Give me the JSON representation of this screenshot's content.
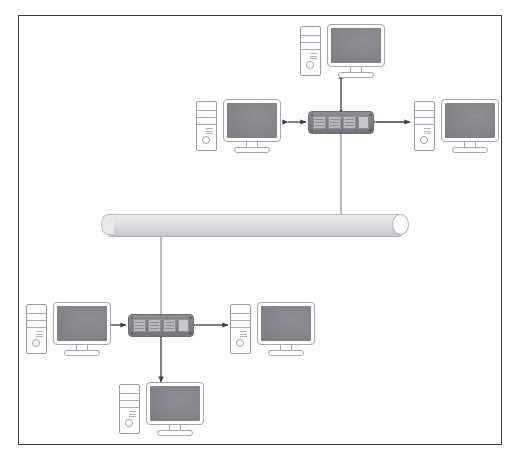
{
  "page": {
    "clipped_top_text": "··    ·   ··",
    "background_color": "#ffffff",
    "frame_border_color": "#3b3b42"
  },
  "palette": {
    "device_outline": "#9a9aa2",
    "screen_fill": "#86868b",
    "switch_body": "#7e7e84",
    "switch_port": "#b9b9bd",
    "bus_fill": "#e2e2e5",
    "connector_line": "#8f8f95",
    "arrow_color": "#3b3b42"
  },
  "diagram": {
    "type": "network-topology",
    "bus": {
      "name": "backbone-bus",
      "label": "",
      "orientation": "horizontal",
      "shape": "cylinder",
      "x": 101,
      "y": 214,
      "width": 308,
      "height": 21
    },
    "switches": [
      {
        "id": "switch-top",
        "label": "",
        "x": 308,
        "y": 111,
        "ports": 3
      },
      {
        "id": "switch-bottom",
        "label": "",
        "x": 128,
        "y": 314,
        "ports": 3
      }
    ],
    "computers": [
      {
        "id": "pc-top-center",
        "label": "",
        "x": 300,
        "y": 24,
        "monitor_x": 27
      },
      {
        "id": "pc-mid-left",
        "label": "",
        "x": 196,
        "y": 99,
        "monitor_x": 27
      },
      {
        "id": "pc-mid-right",
        "label": "",
        "x": 414,
        "y": 99,
        "monitor_x": 27
      },
      {
        "id": "pc-bottom-left",
        "label": "",
        "x": 26,
        "y": 302,
        "monitor_x": 27
      },
      {
        "id": "pc-bottom-right",
        "label": "",
        "x": 230,
        "y": 302,
        "monitor_x": 27
      },
      {
        "id": "pc-bottom-lower",
        "label": "",
        "x": 119,
        "y": 382,
        "monitor_x": 27
      }
    ],
    "links": [
      {
        "id": "link-bus-switch-top",
        "from": "switch-top",
        "to": "bus",
        "style": "plain-line"
      },
      {
        "id": "link-bus-switch-bottom",
        "from": "bus",
        "to": "switch-bottom",
        "style": "plain-line"
      },
      {
        "id": "link-top-center-pc",
        "from": "switch-top",
        "to": "pc-top-center",
        "style": "double-arrow"
      },
      {
        "id": "link-mid-left-pc",
        "from": "pc-mid-left",
        "to": "switch-top",
        "style": "double-arrow"
      },
      {
        "id": "link-mid-right-pc",
        "from": "switch-top",
        "to": "pc-mid-right",
        "style": "double-arrow"
      },
      {
        "id": "link-bottom-left-pc",
        "from": "pc-bottom-left",
        "to": "switch-bottom",
        "style": "double-arrow"
      },
      {
        "id": "link-bottom-right-pc",
        "from": "switch-bottom",
        "to": "pc-bottom-right",
        "style": "double-arrow"
      },
      {
        "id": "link-bottom-lower-pc",
        "from": "switch-bottom",
        "to": "pc-bottom-lower",
        "style": "double-arrow"
      }
    ]
  }
}
